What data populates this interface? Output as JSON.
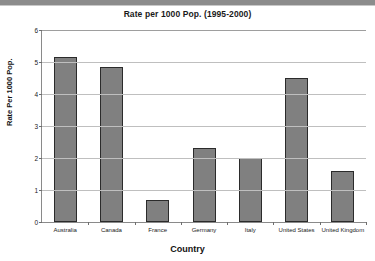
{
  "chart_data": {
    "type": "bar",
    "title": "Rate per 1000 Pop. (1995-2000)",
    "xlabel": "Country",
    "ylabel": "Rate Per 1000 Pop.",
    "categories": [
      "Australia",
      "Canada",
      "France",
      "Germany",
      "Italy",
      "United States",
      "United Kingdom"
    ],
    "values": [
      5.15,
      4.85,
      0.7,
      2.3,
      2.0,
      4.5,
      1.6
    ],
    "ylim": [
      0,
      6
    ],
    "yticks": [
      0,
      1,
      2,
      3,
      4,
      5,
      6
    ],
    "ytick_labels": [
      "0",
      "1",
      "2",
      "3",
      "4",
      "5",
      "6"
    ],
    "grid": true,
    "legend": false,
    "bar_color": "#808080",
    "bar_edge_color": "#2b2b2b",
    "grid_color": "#bfbfbf",
    "axis_color": "#8a8a8a",
    "plot_background": "#ffffff"
  }
}
